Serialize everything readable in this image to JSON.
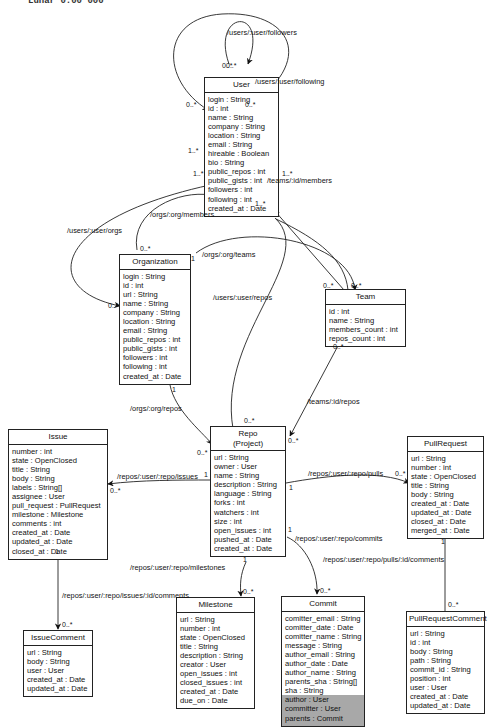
{
  "caption": "Lunar 0.00 000",
  "classes": {
    "user": {
      "name": "User",
      "attributes": [
        "login : String",
        "id : int",
        "name : String",
        "company : String",
        "location : String",
        "email : String",
        "hireable : Boolean",
        "bio : String",
        "public_repos : int",
        "public_gists : int",
        "followers : int",
        "following : int",
        "created_at : Date"
      ]
    },
    "organization": {
      "name": "Organization",
      "attributes": [
        "login : String",
        "id : int",
        "url : String",
        "name : String",
        "company : String",
        "location : String",
        "email : String",
        "public_repos : int",
        "public_gists : int",
        "followers : int",
        "following : int",
        "created_at : Date"
      ]
    },
    "team": {
      "name": "Team",
      "attributes": [
        "id : int",
        "name : String",
        "members_count : int",
        "repos_count : int"
      ]
    },
    "repo": {
      "name": "Repo",
      "subtitle": "(Project)",
      "attributes": [
        "url : String",
        "owner : User",
        "name : String",
        "description : String",
        "language : String",
        "forks : int",
        "watchers : int",
        "size : int",
        "open_issues : int",
        "pushed_at : Date",
        "created_at : Date"
      ]
    },
    "issue": {
      "name": "Issue",
      "attributes": [
        "number : int",
        "state : OpenClosed",
        "title : String",
        "body : String",
        "labels : String[]",
        "assignee : User",
        "pull_request : PullRequest",
        "milestone : Milestone",
        "comments : int",
        "created_at : Date",
        "updated_at : Date",
        "closed_at : Date"
      ]
    },
    "pullrequest": {
      "name": "PullRequest",
      "attributes": [
        "url : String",
        "number : int",
        "state : OpenClosed",
        "title : String",
        "body : String",
        "created_at : Date",
        "updated_at : Date",
        "closed_at : Date",
        "merged_at : Date"
      ]
    },
    "issuecomment": {
      "name": "IssueComment",
      "attributes": [
        "url : String",
        "body : String",
        "user : User",
        "created_at : Date",
        "updated_at : Date"
      ]
    },
    "milestone": {
      "name": "Milestone",
      "attributes": [
        "url : String",
        "number : int",
        "state : OpenClosed",
        "title : String",
        "description : String",
        "creator : User",
        "open_issues : int",
        "closed_issues : int",
        "created_at : Date",
        "due_on : Date"
      ]
    },
    "commit": {
      "name": "Commit",
      "attributes": [
        "comitter_email : String",
        "comitter_date : Date",
        "comitter_name : String",
        "message : String",
        "author_email : String",
        "author_date : Date",
        "author_name : String",
        "parents_sha : String[]",
        "sha : String"
      ],
      "shaded_attributes": [
        "author : User",
        "committer : User",
        "parents : Commit"
      ]
    },
    "pullrequestcomment": {
      "name": "PullRequestComment",
      "attributes": [
        "url : String",
        "id : int",
        "body : String",
        "path : String",
        "commit_id : String",
        "position : int",
        "user : User",
        "created_at : Date",
        "updated_at : Date"
      ]
    }
  },
  "associations": {
    "followers": "/users/:user/followers",
    "following": "/users/:user/following",
    "user_orgs": "/users/:user/orgs",
    "org_members": "/orgs/:org/members",
    "org_teams": "/orgs/:org/teams",
    "team_members": "/teams/:id/members",
    "user_repos": "/users/:user/repos",
    "org_repos": "/orgs/:org/repos",
    "team_repos": "/teams/:id/repos",
    "repo_issues": "/repos/:user/:repo/issues",
    "repo_pulls": "/repos/:user/:repo/pulls",
    "repo_commits": "/repos/:user/:repo/commits",
    "repo_milestones": "/repos/:user/:repo/milestones",
    "issue_comments": "/repos/:user/:repo/issues/:id/comments",
    "pull_comments": "/repos/:user/:repo/pulls/:id/comments"
  },
  "multiplicities": {
    "many": "0..*",
    "one_many": "1..*",
    "one": "1"
  }
}
